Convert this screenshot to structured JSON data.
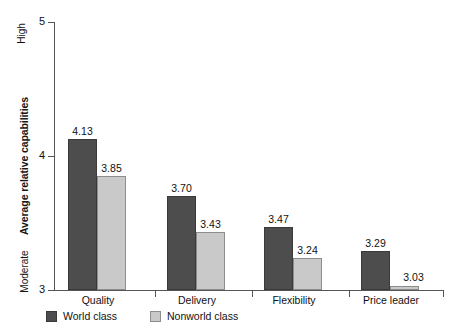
{
  "chart_data": {
    "type": "bar",
    "title": "",
    "xlabel": "",
    "ylabel": "Average relative capabilities",
    "ylim": [
      3,
      5
    ],
    "yticks": [
      "3",
      "4",
      "5"
    ],
    "y_axis_low_label": "Moderate",
    "y_axis_high_label": "High",
    "grid": false,
    "legend_position": "bottom-left",
    "categories": [
      "Quality",
      "Delivery",
      "Flexibility",
      "Price leader"
    ],
    "series": [
      {
        "name": "World class",
        "color": "#4d4d4d",
        "values": [
          4.13,
          3.7,
          3.47,
          3.29
        ],
        "labels": [
          "4.13",
          "3.70",
          "3.47",
          "3.29"
        ]
      },
      {
        "name": "Nonworld class",
        "color": "#c9c9c9",
        "values": [
          3.85,
          3.43,
          3.24,
          3.03
        ],
        "labels": [
          "3.85",
          "3.43",
          "3.24",
          "3.03"
        ]
      }
    ]
  },
  "axis": {
    "y_title": "Average relative capabilities",
    "high_label": "High",
    "moderate_label": "Moderate",
    "ticks": [
      {
        "label": "5",
        "value": 5
      },
      {
        "label": "4",
        "value": 4
      },
      {
        "label": "3",
        "value": 3
      }
    ]
  },
  "groups": [
    {
      "category": "Quality",
      "bars": [
        {
          "series": "World class",
          "label": "4.13",
          "value": 4.13
        },
        {
          "series": "Nonworld class",
          "label": "3.85",
          "value": 3.85
        }
      ]
    },
    {
      "category": "Delivery",
      "bars": [
        {
          "series": "World class",
          "label": "3.70",
          "value": 3.7
        },
        {
          "series": "Nonworld class",
          "label": "3.43",
          "value": 3.43
        }
      ]
    },
    {
      "category": "Flexibility",
      "bars": [
        {
          "series": "World class",
          "label": "3.47",
          "value": 3.47
        },
        {
          "series": "Nonworld class",
          "label": "3.24",
          "value": 3.24
        }
      ]
    },
    {
      "category": "Price leader",
      "bars": [
        {
          "series": "World class",
          "label": "3.29",
          "value": 3.29
        },
        {
          "series": "Nonworld class",
          "label": "3.03",
          "value": 3.03
        }
      ]
    }
  ],
  "legend": {
    "items": [
      {
        "label": "World class",
        "color": "#4d4d4d"
      },
      {
        "label": "Nonworld class",
        "color": "#c9c9c9"
      }
    ]
  }
}
